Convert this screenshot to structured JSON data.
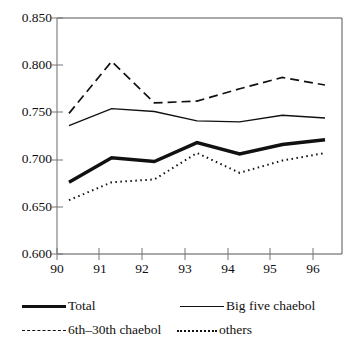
{
  "chart_data": {
    "type": "line",
    "title": "",
    "xlabel": "",
    "ylabel": "",
    "categories": [
      "90",
      "91",
      "92",
      "93",
      "94",
      "95",
      "96"
    ],
    "x": [
      90,
      91,
      92,
      93,
      94,
      95,
      96
    ],
    "ylim": [
      0.6,
      0.85
    ],
    "yticks": [
      0.6,
      0.65,
      0.7,
      0.75,
      0.8,
      0.85
    ],
    "ytick_labels": [
      "0.600",
      "0.650",
      "0.700",
      "0.750",
      "0.800",
      "0.850"
    ],
    "xtick_labels": [
      "90",
      "91",
      "92",
      "93",
      "94",
      "95",
      "96"
    ],
    "grid": false,
    "legend_position": "below",
    "series": [
      {
        "name": "Total",
        "style": "thick-solid",
        "color": "#111111",
        "values": [
          0.676,
          0.702,
          0.698,
          0.718,
          0.706,
          0.716,
          0.721
        ]
      },
      {
        "name": "Big five chaebol",
        "style": "solid",
        "color": "#111111",
        "values": [
          0.736,
          0.754,
          0.751,
          0.741,
          0.74,
          0.747,
          0.744
        ]
      },
      {
        "name": "6th–30th chaebol",
        "style": "dashed",
        "color": "#111111",
        "values": [
          0.749,
          0.804,
          0.76,
          0.762,
          0.775,
          0.787,
          0.779
        ]
      },
      {
        "name": "others",
        "style": "dotted",
        "color": "#111111",
        "values": [
          0.657,
          0.676,
          0.679,
          0.707,
          0.686,
          0.699,
          0.707
        ]
      }
    ]
  },
  "axis": {
    "ytick_labels": [
      "0.850",
      "0.800",
      "0.750",
      "0.700",
      "0.650",
      "0.600"
    ],
    "xtick_labels": [
      "90",
      "91",
      "92",
      "93",
      "94",
      "95",
      "96"
    ]
  },
  "legend": {
    "items": [
      {
        "label": "Total",
        "style": "thick-solid"
      },
      {
        "label": "Big five chaebol",
        "style": "solid"
      },
      {
        "label": "6th–30th chaebol",
        "style": "dashed"
      },
      {
        "label": "others",
        "style": "dotted"
      }
    ]
  }
}
